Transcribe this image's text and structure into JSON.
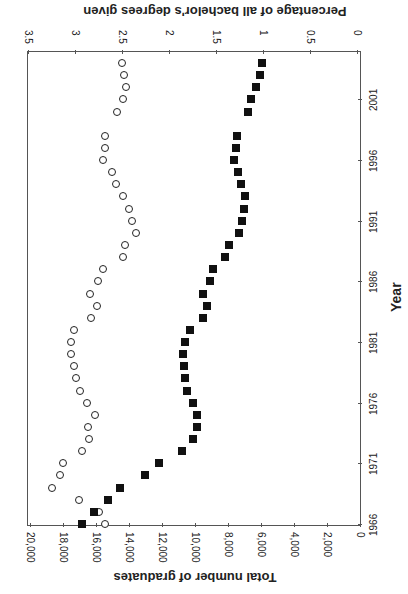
{
  "chart_data": {
    "type": "scatter",
    "orientation_note_visible": "rotated",
    "xlabel": "Year",
    "ylabel_left": "Total number of graduates",
    "ylabel_right": "Percentage of all bachelor's degrees given",
    "x_ticks": [
      "1966",
      "1971",
      "1976",
      "1981",
      "1986",
      "1991",
      "1996",
      "2001"
    ],
    "y_left_ticks": [
      "0",
      "2,000",
      "4,000",
      "6,000",
      "8,000",
      "10,000",
      "12,000",
      "14,000",
      "16,000",
      "18,000",
      "20,000"
    ],
    "y_right_ticks": [
      "0",
      "0.5",
      "1",
      "1.5",
      "2",
      "2.5",
      "3",
      "3.5"
    ],
    "y_left_range": [
      0,
      20000
    ],
    "y_right_range": [
      0,
      3.5
    ],
    "x_range": [
      1966,
      2004
    ],
    "grid": false,
    "series": [
      {
        "name": "Total number of graduates",
        "marker": "filled-square",
        "axis": "left",
        "x": [
          1966,
          1967,
          1968,
          1969,
          1970,
          1971,
          1972,
          1973,
          1974,
          1975,
          1976,
          1977,
          1978,
          1979,
          1980,
          1981,
          1982,
          1983,
          1984,
          1985,
          1986,
          1987,
          1988,
          1989,
          1990,
          1991,
          1992,
          1993,
          1994,
          1995,
          1996,
          1997,
          1998,
          2000,
          2001,
          2002,
          2003,
          2004
        ],
        "values": [
          16850,
          16120,
          15270,
          14540,
          13030,
          12180,
          10790,
          10120,
          9880,
          9880,
          10120,
          10480,
          10610,
          10670,
          10730,
          10610,
          10300,
          9510,
          9270,
          9510,
          9090,
          8910,
          8180,
          7940,
          7330,
          7150,
          7030,
          6970,
          7210,
          7390,
          7640,
          7510,
          7450,
          6790,
          6610,
          6300,
          6060,
          5940
        ]
      },
      {
        "name": "Percentage of all bachelor's degrees given",
        "marker": "open-circle",
        "axis": "right",
        "x": [
          1966,
          1967,
          1968,
          1969,
          1970,
          1971,
          1972,
          1973,
          1974,
          1975,
          1976,
          1977,
          1978,
          1979,
          1980,
          1981,
          1982,
          1983,
          1984,
          1985,
          1986,
          1987,
          1988,
          1989,
          1990,
          1991,
          1992,
          1993,
          1994,
          1995,
          1996,
          1997,
          1998,
          2000,
          2001,
          2002,
          2003,
          2004
        ],
        "values": [
          2.68,
          2.74,
          2.96,
          3.24,
          3.16,
          3.13,
          2.93,
          2.85,
          2.86,
          2.79,
          2.87,
          2.95,
          2.99,
          3.01,
          3.04,
          3.04,
          3.01,
          2.83,
          2.77,
          2.84,
          2.76,
          2.7,
          2.49,
          2.47,
          2.35,
          2.39,
          2.43,
          2.49,
          2.56,
          2.61,
          2.7,
          2.68,
          2.68,
          2.55,
          2.49,
          2.46,
          2.48,
          2.5
        ]
      }
    ]
  }
}
